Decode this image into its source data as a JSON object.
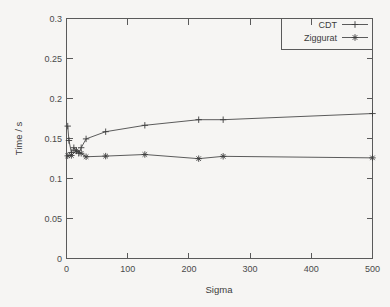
{
  "figure": {
    "background_color": "#f6f5f3",
    "axis_color": "#5a5a5a",
    "series_color": "#4a4a4a"
  },
  "chart_data": {
    "type": "line",
    "title": "",
    "xlabel": "Sigma",
    "ylabel": "Time / s",
    "xlim": [
      0,
      500
    ],
    "ylim": [
      0,
      0.3
    ],
    "grid": false,
    "legend_position": "top-right-inside",
    "xticks": [
      0,
      100,
      200,
      300,
      400,
      500
    ],
    "xtick_labels": [
      "0",
      "100",
      "200",
      "300",
      "400",
      "500"
    ],
    "yticks": [
      0,
      0.05,
      0.1,
      0.15,
      0.2,
      0.25,
      0.3
    ],
    "ytick_labels": [
      "0",
      "0.05",
      "0.1",
      "0.15",
      "0.2",
      "0.25",
      "0.3"
    ],
    "series": [
      {
        "name": "CDT",
        "marker": "plus",
        "x": [
          2,
          4,
          8,
          12,
          16,
          20,
          24,
          32,
          64,
          128,
          216,
          256,
          500
        ],
        "y": [
          0.1655,
          0.1475,
          0.1325,
          0.1385,
          0.1345,
          0.1315,
          0.1385,
          0.1495,
          0.1585,
          0.1665,
          0.1735,
          0.1735,
          0.1812
        ]
      },
      {
        "name": "Ziggurat",
        "marker": "star",
        "x": [
          2,
          8,
          16,
          24,
          32,
          64,
          128,
          216,
          256,
          500
        ],
        "y": [
          0.1283,
          0.1288,
          0.1345,
          0.1315,
          0.1272,
          0.128,
          0.13,
          0.1248,
          0.1277,
          0.1258
        ]
      }
    ]
  },
  "legend": {
    "entries": [
      {
        "label": "CDT"
      },
      {
        "label": "Ziggurat"
      }
    ]
  }
}
